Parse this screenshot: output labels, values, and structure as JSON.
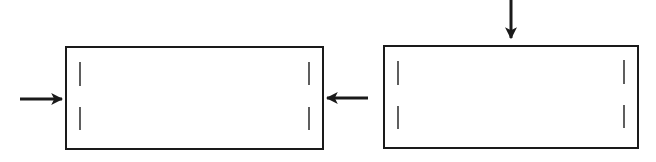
{
  "diagram": {
    "background": "#ffffff",
    "stroke_color": "#1a1a1a",
    "panels": [
      {
        "name": "left-panel",
        "rect": {
          "x": 66,
          "y": 47,
          "w": 257,
          "h": 102
        },
        "ticks": [
          {
            "x": 80,
            "y1": 62,
            "y2": 86
          },
          {
            "x": 80,
            "y1": 107,
            "y2": 130
          },
          {
            "x": 309,
            "y1": 62,
            "y2": 85
          },
          {
            "x": 309,
            "y1": 107,
            "y2": 130
          }
        ]
      },
      {
        "name": "right-panel",
        "rect": {
          "x": 384,
          "y": 46,
          "w": 254,
          "h": 102
        },
        "ticks": [
          {
            "x": 398,
            "y1": 61,
            "y2": 85
          },
          {
            "x": 398,
            "y1": 106,
            "y2": 129
          },
          {
            "x": 624,
            "y1": 60,
            "y2": 84
          },
          {
            "x": 624,
            "y1": 105,
            "y2": 128
          }
        ]
      }
    ],
    "arrows": [
      {
        "name": "arrow-right-into-left-panel",
        "direction": "right",
        "x1": 20,
        "y1": 99,
        "x2": 62,
        "y2": 99
      },
      {
        "name": "arrow-left-into-left-panel",
        "direction": "left",
        "x1": 368,
        "y1": 98,
        "x2": 327,
        "y2": 98
      },
      {
        "name": "arrow-down-into-right-panel",
        "direction": "down",
        "x1": 511,
        "y1": 0,
        "x2": 511,
        "y2": 38
      }
    ]
  }
}
